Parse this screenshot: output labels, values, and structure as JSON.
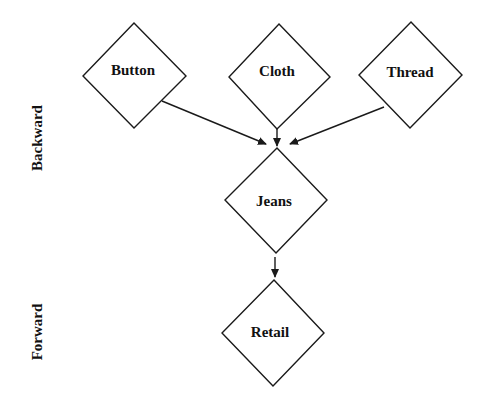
{
  "diagram": {
    "type": "supply-chain-flow",
    "side_labels": {
      "backward": "Backward",
      "forward": "Forward"
    },
    "nodes": {
      "button": {
        "label": "Button",
        "cx": 134,
        "cy": 76
      },
      "cloth": {
        "label": "Cloth",
        "cx": 279,
        "cy": 77
      },
      "thread": {
        "label": "Thread",
        "cx": 410,
        "cy": 75
      },
      "jeans": {
        "label": "Jeans",
        "cx": 276,
        "cy": 200
      },
      "retail": {
        "label": "Retail",
        "cx": 273,
        "cy": 333
      }
    },
    "edges": [
      {
        "from": "Button",
        "to": "Jeans"
      },
      {
        "from": "Cloth",
        "to": "Jeans"
      },
      {
        "from": "Thread",
        "to": "Jeans"
      },
      {
        "from": "Jeans",
        "to": "Retail"
      }
    ],
    "colors": {
      "stroke": "#1a1a1a",
      "text": "#111111",
      "background": "#ffffff"
    }
  }
}
